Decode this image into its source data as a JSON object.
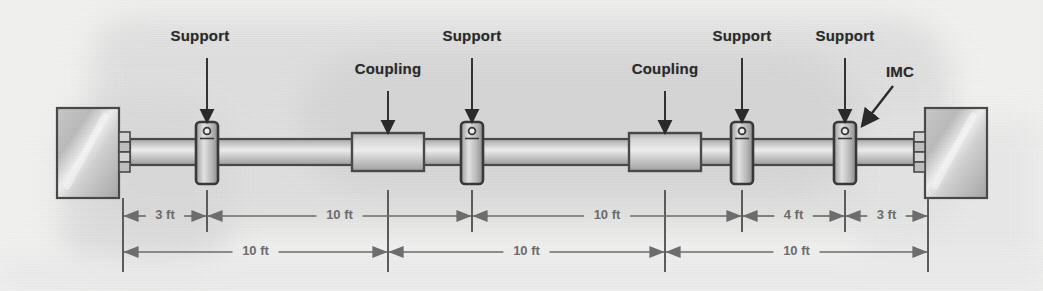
{
  "figure": {
    "colors": {
      "paper": "#f2f2f1",
      "ink": "#2b2b2b",
      "dimension_grey": "#6e6e6e",
      "metal_light": "#dcdcdc",
      "metal_mid": "#c3c3c3",
      "metal_dark": "#9a9a9a",
      "outline": "#4a4a4a"
    }
  },
  "callouts": [
    {
      "id": "support-1",
      "label": "Support",
      "text_x": 200,
      "text_y": 38,
      "anchor": "middle",
      "arrow": {
        "x1": 207,
        "y1": 58,
        "x2": 207,
        "y2": 122,
        "type": "straight"
      }
    },
    {
      "id": "coupling-1",
      "label": "Coupling",
      "text_x": 388,
      "text_y": 71,
      "anchor": "middle",
      "arrow": {
        "x1": 388,
        "y1": 91,
        "x2": 388,
        "y2": 133,
        "type": "straight"
      }
    },
    {
      "id": "support-2",
      "label": "Support",
      "text_x": 472,
      "text_y": 38,
      "anchor": "middle",
      "arrow": {
        "x1": 472,
        "y1": 58,
        "x2": 472,
        "y2": 122,
        "type": "straight"
      }
    },
    {
      "id": "coupling-2",
      "label": "Coupling",
      "text_x": 665,
      "text_y": 71,
      "anchor": "middle",
      "arrow": {
        "x1": 665,
        "y1": 91,
        "x2": 665,
        "y2": 133,
        "type": "straight"
      }
    },
    {
      "id": "support-3",
      "label": "Support",
      "text_x": 742,
      "text_y": 38,
      "anchor": "middle",
      "arrow": {
        "x1": 742,
        "y1": 58,
        "x2": 742,
        "y2": 122,
        "type": "straight"
      }
    },
    {
      "id": "support-4",
      "label": "Support",
      "text_x": 845,
      "text_y": 38,
      "anchor": "middle",
      "arrow": {
        "x1": 845,
        "y1": 58,
        "x2": 845,
        "y2": 122,
        "type": "straight"
      }
    },
    {
      "id": "imc",
      "label": "IMC",
      "text_x": 900,
      "text_y": 74,
      "anchor": "middle",
      "arrow": {
        "x1": 893,
        "y1": 86,
        "x2": 862,
        "y2": 126,
        "type": "diagonal"
      }
    }
  ],
  "structure": {
    "walls": [
      {
        "id": "wall-left",
        "x": 57,
        "y": 108,
        "w": 62,
        "h": 90
      },
      {
        "id": "wall-right",
        "x": 925,
        "y": 108,
        "w": 62,
        "h": 90
      }
    ],
    "flanges": [
      {
        "id": "flange-left",
        "x": 119,
        "y": 132,
        "w": 11,
        "h": 40,
        "segments": 4
      },
      {
        "id": "flange-right",
        "x": 914,
        "y": 132,
        "w": 11,
        "h": 40,
        "segments": 4
      }
    ],
    "pipe": {
      "id": "imc-conduit",
      "x": 130,
      "y": 139,
      "w": 784,
      "h": 26
    },
    "couplings": [
      {
        "id": "coupling-body-1",
        "x": 352,
        "y": 133,
        "w": 72,
        "h": 38
      },
      {
        "id": "coupling-body-2",
        "x": 629,
        "y": 133,
        "w": 72,
        "h": 38
      }
    ],
    "supports": [
      {
        "id": "support-body-1",
        "x": 196,
        "y": 122,
        "w": 22,
        "h": 62
      },
      {
        "id": "support-body-2",
        "x": 461,
        "y": 122,
        "w": 22,
        "h": 62
      },
      {
        "id": "support-body-3",
        "x": 731,
        "y": 122,
        "w": 22,
        "h": 62
      },
      {
        "id": "support-body-4",
        "x": 834,
        "y": 122,
        "w": 22,
        "h": 62
      }
    ]
  },
  "dimensions": {
    "extension_lines": [
      {
        "id": "ext-wall-left",
        "x": 123,
        "y1": 198,
        "y2": 272
      },
      {
        "id": "ext-support-1",
        "x": 207,
        "y1": 190,
        "y2": 232
      },
      {
        "id": "ext-coupling-1",
        "x": 388,
        "y1": 190,
        "y2": 272
      },
      {
        "id": "ext-support-2",
        "x": 472,
        "y1": 190,
        "y2": 232
      },
      {
        "id": "ext-coupling-2",
        "x": 665,
        "y1": 190,
        "y2": 272
      },
      {
        "id": "ext-support-3",
        "x": 742,
        "y1": 190,
        "y2": 232
      },
      {
        "id": "ext-support-4",
        "x": 845,
        "y1": 190,
        "y2": 232
      },
      {
        "id": "ext-wall-right",
        "x": 928,
        "y1": 198,
        "y2": 272
      }
    ],
    "rows": [
      {
        "id": "dim-row-upper",
        "y": 216,
        "segments": [
          {
            "id": "seg-3ft-left",
            "label": "3 ft",
            "x1": 123,
            "x2": 207
          },
          {
            "id": "seg-10ft-a",
            "label": "10 ft",
            "x1": 207,
            "x2": 472
          },
          {
            "id": "seg-10ft-b",
            "label": "10 ft",
            "x1": 472,
            "x2": 742
          },
          {
            "id": "seg-4ft",
            "label": "4 ft",
            "x1": 742,
            "x2": 845
          },
          {
            "id": "seg-3ft-right",
            "label": "3 ft",
            "x1": 845,
            "x2": 928
          }
        ]
      },
      {
        "id": "dim-row-lower",
        "y": 252,
        "segments": [
          {
            "id": "seg-span-1",
            "label": "10 ft",
            "x1": 123,
            "x2": 388
          },
          {
            "id": "seg-span-2",
            "label": "10 ft",
            "x1": 388,
            "x2": 665
          },
          {
            "id": "seg-span-3",
            "label": "10 ft",
            "x1": 665,
            "x2": 928
          }
        ]
      }
    ]
  }
}
